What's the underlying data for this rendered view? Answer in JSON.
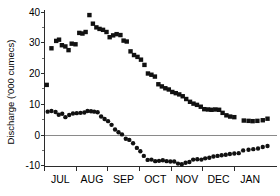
{
  "chart_data": {
    "type": "scatter",
    "title": "",
    "subtitle": "",
    "xlabel": "",
    "ylabel": "Discharge ('000 cumecs)",
    "grid": false,
    "legend": "none",
    "zero_line": true,
    "zero_line_color": "#8a8a8a",
    "marker_color": "#111111",
    "xlim": [
      0,
      7.35
    ],
    "ylim": [
      -11.5,
      41.5
    ],
    "ytick_values": [
      40,
      30,
      20,
      10,
      0,
      -10
    ],
    "ytick_labels": [
      "40",
      "30",
      "20",
      "10",
      "0",
      "-10"
    ],
    "yminor_step": 5,
    "xtick_positions": [
      0.5,
      1.5,
      2.5,
      3.5,
      4.5,
      5.5,
      6.5
    ],
    "xtick_labels": [
      "JUL",
      "AUG",
      "SEP",
      "OCT",
      "NOV",
      "DEC",
      "JAN"
    ],
    "x_unit": "month index from 1 July",
    "series": [
      {
        "name": "Upper series",
        "marker": "square",
        "x": [
          0.07,
          0.22,
          0.37,
          0.46,
          0.55,
          0.66,
          0.76,
          0.86,
          0.98,
          1.1,
          1.2,
          1.3,
          1.42,
          1.53,
          1.64,
          1.74,
          1.85,
          1.96,
          2.06,
          2.17,
          2.28,
          2.4,
          2.5,
          2.6,
          2.72,
          2.83,
          2.94,
          3.05,
          3.16,
          3.27,
          3.38,
          3.49,
          3.6,
          3.71,
          3.82,
          3.93,
          4.04,
          4.15,
          4.26,
          4.37,
          4.48,
          4.6,
          4.71,
          4.82,
          4.94,
          5.05,
          5.17,
          5.28,
          5.4,
          5.52,
          5.63,
          5.75,
          5.87,
          6.0,
          6.3,
          6.45,
          6.58,
          6.73,
          6.9,
          7.05
        ],
        "y": [
          16.3,
          28.2,
          30.6,
          31.0,
          29.2,
          28.8,
          27.6,
          29.7,
          29.5,
          33.2,
          33.0,
          33.5,
          39.0,
          36.2,
          35.0,
          34.5,
          34.2,
          33.5,
          31.8,
          32.4,
          32.8,
          32.5,
          30.7,
          30.4,
          27.2,
          26.0,
          25.4,
          24.5,
          22.8,
          20.0,
          19.6,
          19.0,
          16.5,
          15.8,
          15.2,
          14.8,
          14.0,
          13.6,
          13.2,
          12.6,
          11.7,
          10.8,
          10.2,
          9.8,
          9.2,
          8.4,
          8.3,
          8.2,
          8.3,
          8.2,
          7.2,
          6.4,
          6.0,
          5.8,
          4.7,
          4.6,
          4.5,
          4.6,
          4.8,
          5.3
        ]
      },
      {
        "name": "Lower series",
        "marker": "circle",
        "x": [
          0.1,
          0.22,
          0.35,
          0.45,
          0.56,
          0.66,
          0.78,
          0.9,
          1.02,
          1.14,
          1.26,
          1.36,
          1.47,
          1.57,
          1.68,
          1.79,
          1.9,
          2.01,
          2.12,
          2.23,
          2.34,
          2.45,
          2.57,
          2.68,
          2.8,
          2.92,
          3.03,
          3.14,
          3.26,
          3.38,
          3.5,
          3.62,
          3.74,
          3.86,
          3.98,
          4.1,
          4.22,
          4.34,
          4.46,
          4.58,
          4.7,
          4.83,
          4.96,
          5.08,
          5.21,
          5.34,
          5.47,
          5.6,
          5.73,
          5.86,
          6.0,
          6.14,
          6.28,
          6.45,
          6.6,
          6.75,
          6.9,
          7.05
        ],
        "y": [
          7.6,
          7.8,
          7.5,
          6.6,
          6.9,
          5.8,
          6.5,
          7.0,
          7.1,
          7.2,
          7.3,
          7.8,
          7.7,
          7.6,
          7.4,
          6.0,
          5.2,
          4.5,
          3.3,
          1.8,
          0.9,
          0.2,
          -1.2,
          -1.6,
          -2.7,
          -4.2,
          -5.3,
          -6.8,
          -8.1,
          -8.0,
          -8.5,
          -8.4,
          -8.2,
          -8.5,
          -8.6,
          -8.6,
          -9.3,
          -9.5,
          -9.0,
          -8.8,
          -8.0,
          -7.9,
          -8.0,
          -7.6,
          -7.4,
          -7.0,
          -6.8,
          -6.6,
          -6.4,
          -6.2,
          -6.0,
          -5.9,
          -5.0,
          -4.8,
          -4.6,
          -4.4,
          -3.9,
          -3.6
        ]
      }
    ]
  },
  "figure": {
    "background_color": "#ffffff",
    "axis_color": "#2b2b2b"
  }
}
